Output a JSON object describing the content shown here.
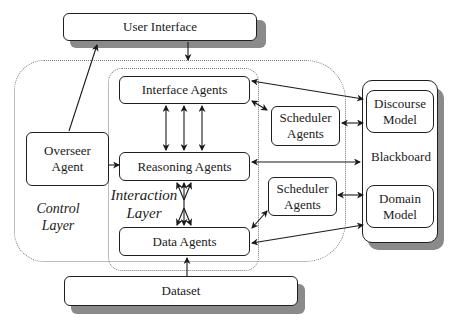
{
  "diagram": {
    "type": "architecture",
    "nodes": {
      "user_interface": "User Interface",
      "interface_agents": "Interface Agents",
      "reasoning_agents": "Reasoning Agents",
      "data_agents": "Data Agents",
      "overseer_agent_line1": "Overseer",
      "overseer_agent_line2": "Agent",
      "scheduler_top_line1": "Scheduler",
      "scheduler_top_line2": "Agents",
      "scheduler_bottom_line1": "Scheduler",
      "scheduler_bottom_line2": "Agents",
      "blackboard": "Blackboard",
      "discourse_model_line1": "Discourse",
      "discourse_model_line2": "Model",
      "domain_model_line1": "Domain",
      "domain_model_line2": "Model",
      "dataset": "Dataset"
    },
    "regions": {
      "control_layer_line1": "Control",
      "control_layer_line2": "Layer",
      "interaction_layer_line1": "Interaction",
      "interaction_layer_line2": "Layer"
    },
    "edges": [
      {
        "from": "User Interface",
        "to": "Interaction Layer",
        "direction": "one-way"
      },
      {
        "from": "Overseer Agent",
        "to": "User Interface",
        "direction": "one-way"
      },
      {
        "from": "Overseer Agent",
        "to": "Reasoning Agents",
        "direction": "one-way"
      },
      {
        "from": "Interface Agents",
        "to": "Reasoning Agents",
        "direction": "two-way",
        "count": 3
      },
      {
        "from": "Reasoning Agents",
        "to": "Data Agents",
        "direction": "two-way",
        "count": 3,
        "style": "crossing"
      },
      {
        "from": "Interface Agents",
        "to": "Discourse Model",
        "direction": "two-way"
      },
      {
        "from": "Interface Agents",
        "to": "Scheduler Agents (top)",
        "direction": "two-way"
      },
      {
        "from": "Scheduler Agents (top)",
        "to": "Discourse Model",
        "direction": "two-way"
      },
      {
        "from": "Reasoning Agents",
        "to": "Blackboard",
        "direction": "two-way"
      },
      {
        "from": "Data Agents",
        "to": "Scheduler Agents (bottom)",
        "direction": "two-way"
      },
      {
        "from": "Scheduler Agents (bottom)",
        "to": "Domain Model",
        "direction": "two-way"
      },
      {
        "from": "Data Agents",
        "to": "Domain Model",
        "direction": "two-way"
      },
      {
        "from": "Dataset",
        "to": "Data Agents",
        "direction": "one-way"
      }
    ]
  }
}
